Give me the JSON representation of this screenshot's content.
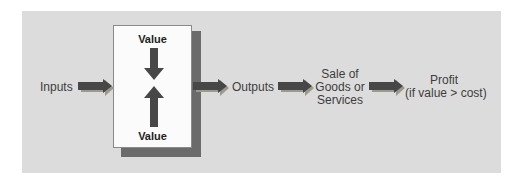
{
  "diagram": {
    "nodes": {
      "inputs": "Inputs",
      "value_top": "Value",
      "value_bottom": "Value",
      "outputs": "Outputs",
      "sale_line1": "Sale of",
      "sale_line2": "Goods or",
      "sale_line3": "Services",
      "profit_line1": "Profit",
      "profit_line2": "(if value > cost)"
    },
    "flow": [
      "Inputs",
      "Value (box)",
      "Outputs",
      "Sale of Goods or Services",
      "Profit (if value > cost)"
    ],
    "colors": {
      "panel": "#dcdcdc",
      "box": "#fbfbfb",
      "box_shadow": "#6b6b6b",
      "arrow": "#474747",
      "arrow_shadow": "#9c9a8c"
    }
  }
}
